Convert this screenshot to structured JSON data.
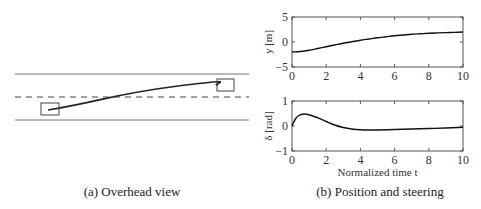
{
  "captions": {
    "left": "(a) Overhead view",
    "right": "(b) Position and steering"
  },
  "overhead_view": {
    "road": {
      "x0": 15,
      "x1": 249,
      "top_line_y": 74,
      "center_dashed_y": 97,
      "bottom_line_y": 120
    },
    "start_car": {
      "x": 41,
      "y": 103,
      "w": 18,
      "h": 12
    },
    "end_car": {
      "x": 217,
      "y": 79,
      "w": 17,
      "h": 12
    },
    "color": "#333333"
  },
  "chart_data": [
    {
      "type": "line",
      "title": "",
      "xlabel": "",
      "ylabel": "y [m]",
      "xlim": [
        0,
        10
      ],
      "ylim": [
        -5,
        5
      ],
      "xticks": [
        "0",
        "2",
        "4",
        "6",
        "8",
        "10"
      ],
      "yticks": [
        "-5",
        "0",
        "5"
      ],
      "grid": false,
      "series": [
        {
          "name": "y",
          "x": [
            0,
            0.5,
            1,
            1.5,
            2,
            2.5,
            3,
            3.5,
            4,
            4.5,
            5,
            5.5,
            6,
            6.5,
            7,
            7.5,
            8,
            8.5,
            9,
            9.5,
            10
          ],
          "values": [
            -2.0,
            -1.9,
            -1.65,
            -1.3,
            -0.95,
            -0.6,
            -0.25,
            0.05,
            0.35,
            0.6,
            0.85,
            1.05,
            1.25,
            1.4,
            1.55,
            1.65,
            1.75,
            1.82,
            1.88,
            1.93,
            2.0
          ]
        }
      ]
    },
    {
      "type": "line",
      "title": "",
      "xlabel": "Normalized time t",
      "ylabel": "δ [rad]",
      "xlim": [
        0,
        10
      ],
      "ylim": [
        -1,
        1
      ],
      "xticks": [
        "0",
        "2",
        "4",
        "6",
        "8",
        "10"
      ],
      "yticks": [
        "-1",
        "0",
        "1"
      ],
      "grid": false,
      "series": [
        {
          "name": "delta",
          "x": [
            0,
            0.2,
            0.4,
            0.7,
            1,
            1.5,
            2,
            2.5,
            3,
            3.5,
            4,
            4.5,
            5,
            6,
            7,
            8,
            9,
            10
          ],
          "values": [
            0.0,
            0.28,
            0.42,
            0.48,
            0.45,
            0.33,
            0.18,
            0.04,
            -0.06,
            -0.12,
            -0.15,
            -0.16,
            -0.16,
            -0.14,
            -0.12,
            -0.1,
            -0.08,
            -0.05
          ]
        }
      ]
    }
  ]
}
